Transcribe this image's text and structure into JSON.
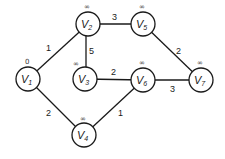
{
  "diagram": {
    "type": "weighted-graph",
    "nodes": [
      {
        "id": "v1",
        "label": "V",
        "sub": "1",
        "distance": "0",
        "x": 28,
        "y": 79
      },
      {
        "id": "v2",
        "label": "V",
        "sub": "2",
        "distance": "∞",
        "x": 88,
        "y": 24
      },
      {
        "id": "v3",
        "label": "V",
        "sub": "3",
        "distance": "∞",
        "x": 85,
        "y": 79
      },
      {
        "id": "v4",
        "label": "V",
        "sub": "4",
        "distance": "∞",
        "x": 84,
        "y": 135
      },
      {
        "id": "v5",
        "label": "V",
        "sub": "5",
        "distance": "∞",
        "x": 143,
        "y": 24
      },
      {
        "id": "v6",
        "label": "V",
        "sub": "6",
        "distance": "∞",
        "x": 143,
        "y": 80
      },
      {
        "id": "v7",
        "label": "V",
        "sub": "7",
        "distance": "∞",
        "x": 201,
        "y": 80
      }
    ],
    "edges": [
      {
        "from": "v1",
        "to": "v2",
        "weight": "1"
      },
      {
        "from": "v1",
        "to": "v4",
        "weight": "2"
      },
      {
        "from": "v2",
        "to": "v5",
        "weight": "3"
      },
      {
        "from": "v2",
        "to": "v3",
        "weight": "5"
      },
      {
        "from": "v3",
        "to": "v6",
        "weight": "2"
      },
      {
        "from": "v4",
        "to": "v6",
        "weight": "1"
      },
      {
        "from": "v5",
        "to": "v7",
        "weight": "2"
      },
      {
        "from": "v6",
        "to": "v7",
        "weight": "3"
      }
    ]
  }
}
